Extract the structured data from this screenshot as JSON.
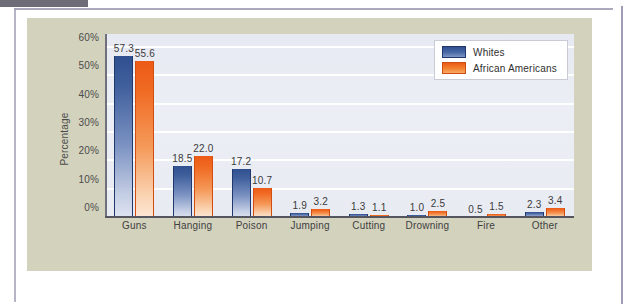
{
  "chart_data": {
    "type": "bar",
    "title": "",
    "xlabel": "",
    "ylabel": "Percentage",
    "ylim": [
      0,
      65
    ],
    "grid": true,
    "legend_position": "top-right",
    "ytick_labels": [
      "0%",
      "10%",
      "20%",
      "30%",
      "40%",
      "50%",
      "60%"
    ],
    "ytick_values": [
      0,
      10,
      20,
      30,
      40,
      50,
      60
    ],
    "categories": [
      "Guns",
      "Hanging",
      "Poison",
      "Jumping",
      "Cutting",
      "Drowning",
      "Fire",
      "Other"
    ],
    "series": [
      {
        "name": "Whites",
        "color": "#34538f",
        "values": [
          57.3,
          18.5,
          17.2,
          1.9,
          1.3,
          1.0,
          0.5,
          2.3
        ],
        "labels": [
          "57.3",
          "18.5",
          "17.2",
          "1.9",
          "1.3",
          "1.0",
          "0.5",
          "2.3"
        ]
      },
      {
        "name": "African Americans",
        "color": "#ee6a1e",
        "values": [
          55.6,
          22.0,
          10.7,
          3.2,
          1.1,
          2.5,
          1.5,
          3.4
        ],
        "labels": [
          "55.6",
          "22.0",
          "10.7",
          "3.2",
          "1.1",
          "2.5",
          "1.5",
          "3.4"
        ]
      }
    ]
  },
  "legend": {
    "items": [
      {
        "label": "Whites"
      },
      {
        "label": "African Americans"
      }
    ]
  },
  "colors": {
    "panel_background": "#d3d2bd",
    "plot_background": "#e9ebf3",
    "gridline": "#ffffff",
    "axis": "#55555f",
    "series_blue": "#34538f",
    "series_orange": "#ee6a1e",
    "page_rule": "#9b9ab2"
  }
}
